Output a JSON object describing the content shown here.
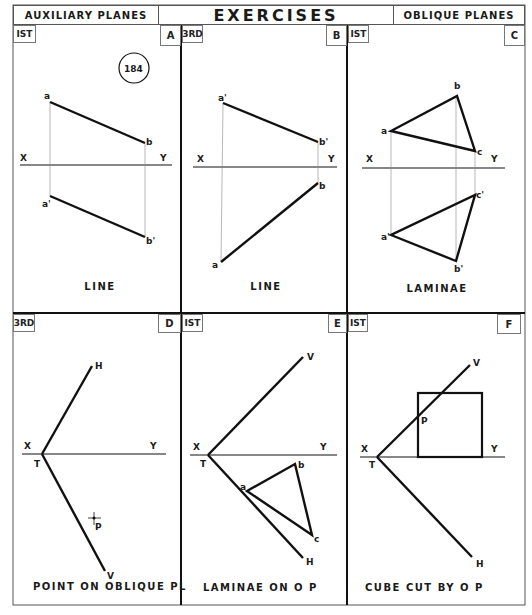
{
  "header": {
    "left": "AUXILIARY  PLANES",
    "title": "EXERCISES",
    "right": "OBLIQUE PLANES"
  },
  "circle_label": "184",
  "panels": [
    {
      "id": "A",
      "angle": "IST",
      "caption": "LINE",
      "points": {
        "a": "a",
        "b": "b",
        "a1": "a'",
        "b1": "b'"
      },
      "x": "X",
      "y": "Y"
    },
    {
      "id": "B",
      "angle": "3RD",
      "caption": "LINE",
      "points": {
        "a": "a",
        "b": "b",
        "a1": "a'",
        "b1": "b'"
      },
      "x": "X",
      "y": "Y"
    },
    {
      "id": "C",
      "angle": "IST",
      "caption": "LAMINAE",
      "points": {
        "a": "a",
        "b": "b",
        "c": "c",
        "a1": "a'",
        "b1": "b'",
        "c1": "c'"
      },
      "x": "X",
      "y": "Y"
    },
    {
      "id": "D",
      "angle": "3RD",
      "caption": "POINT  ON  OBLIQUE  PL",
      "points": {
        "h": "H",
        "v": "V",
        "t": "T",
        "p": "P"
      },
      "x": "X",
      "y": "Y"
    },
    {
      "id": "E",
      "angle": "IST",
      "caption": "LAMINAE   ON   O  P",
      "points": {
        "v": "V",
        "h": "H",
        "t": "T",
        "a": "a",
        "b": "b",
        "c": "c"
      },
      "x": "X",
      "y": "Y"
    },
    {
      "id": "F",
      "angle": "IST",
      "caption": "CUBE   CUT   BY   O  P",
      "points": {
        "v": "V",
        "h": "H",
        "t": "T",
        "p": "P"
      },
      "x": "X",
      "y": "Y"
    }
  ]
}
